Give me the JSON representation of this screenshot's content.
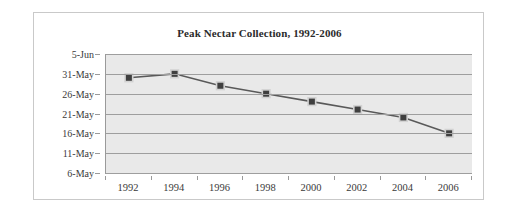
{
  "chart_data": {
    "type": "line",
    "title": "Peak Nectar Collection, 1992-2006",
    "xlabel": "",
    "ylabel": "",
    "categories": [
      "1992",
      "1994",
      "1996",
      "1998",
      "2000",
      "2002",
      "2004",
      "2006"
    ],
    "x": [
      1992,
      1994,
      1996,
      1998,
      2000,
      2002,
      2004,
      2006
    ],
    "ytick_labels": [
      "5-Jun",
      "31-May",
      "26-May",
      "21-May",
      "16-May",
      "11-May",
      "6-May"
    ],
    "ytick_values": [
      156,
      151,
      146,
      141,
      136,
      131,
      126
    ],
    "ylim": [
      126,
      156
    ],
    "values": [
      130,
      130,
      130,
      130,
      130,
      130,
      130,
      130
    ],
    "series": [
      {
        "name": "Peak nectar collection date",
        "value_labels": [
          "30-May",
          "31-May",
          "28-May",
          "26-May",
          "24-May",
          "22-May",
          "20-May",
          "16-May"
        ],
        "values": [
          150,
          151,
          148,
          146,
          144,
          142,
          140,
          136
        ]
      }
    ],
    "grid": true,
    "gridlines_horizontal": 7,
    "legend": "none",
    "marker": "square",
    "colors": {
      "line": "#595959",
      "marker": "#3f3f3f",
      "plot_background": "#e9e9e9",
      "gridline": "#9e9e9e",
      "axis": "#9a9a9a",
      "frame_border": "#c9c9c9",
      "text": "#3a3a3a",
      "title_text": "#2b2b2b",
      "page_background": "#ffffff"
    }
  }
}
